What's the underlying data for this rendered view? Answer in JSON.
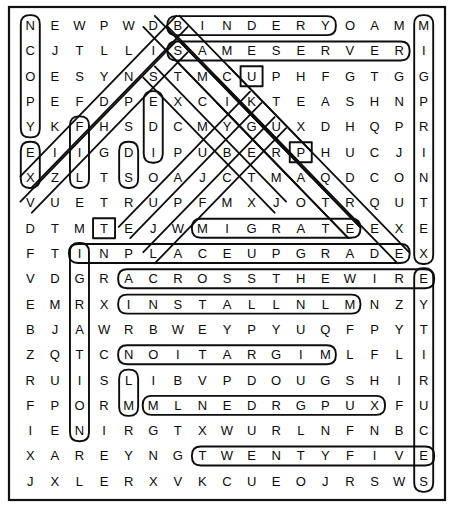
{
  "puzzle": {
    "kind": "word-search",
    "rows": 19,
    "cols": 17,
    "grid": [
      [
        "N",
        "E",
        "W",
        "P",
        "W",
        "D",
        "B",
        "I",
        "N",
        "D",
        "E",
        "R",
        "Y",
        "O",
        "A",
        "M",
        "M"
      ],
      [
        "C",
        "J",
        "T",
        "L",
        "L",
        "I",
        "S",
        "A",
        "M",
        "E",
        "S",
        "E",
        "R",
        "V",
        "E",
        "R",
        "I"
      ],
      [
        "O",
        "E",
        "S",
        "Y",
        "N",
        "S",
        "T",
        "M",
        "C",
        "U",
        "P",
        "H",
        "F",
        "G",
        "T",
        "G",
        "G"
      ],
      [
        "P",
        "E",
        "F",
        "D",
        "P",
        "E",
        "X",
        "C",
        "I",
        "K",
        "T",
        "E",
        "A",
        "S",
        "H",
        "N",
        "P"
      ],
      [
        "Y",
        "K",
        "F",
        "H",
        "S",
        "D",
        "C",
        "M",
        "Y",
        "G",
        "U",
        "X",
        "D",
        "H",
        "Q",
        "P",
        "R"
      ],
      [
        "E",
        "I",
        "I",
        "G",
        "D",
        "I",
        "P",
        "U",
        "B",
        "E",
        "R",
        "P",
        "H",
        "U",
        "C",
        "J",
        "I"
      ],
      [
        "X",
        "Z",
        "L",
        "T",
        "S",
        "O",
        "A",
        "J",
        "C",
        "T",
        "M",
        "A",
        "Q",
        "D",
        "C",
        "O",
        "N"
      ],
      [
        "V",
        "U",
        "E",
        "T",
        "R",
        "U",
        "P",
        "F",
        "M",
        "X",
        "J",
        "O",
        "T",
        "R",
        "Q",
        "U",
        "T"
      ],
      [
        "D",
        "T",
        "M",
        "T",
        "E",
        "J",
        "W",
        "M",
        "I",
        "G",
        "R",
        "A",
        "T",
        "E",
        "E",
        "X",
        "E"
      ],
      [
        "F",
        "T",
        "I",
        "N",
        "P",
        "L",
        "A",
        "C",
        "E",
        "U",
        "P",
        "G",
        "R",
        "A",
        "D",
        "E",
        "X"
      ],
      [
        "V",
        "D",
        "G",
        "R",
        "A",
        "C",
        "R",
        "O",
        "S",
        "S",
        "T",
        "H",
        "E",
        "W",
        "I",
        "R",
        "E"
      ],
      [
        "E",
        "M",
        "R",
        "X",
        "I",
        "N",
        "S",
        "T",
        "A",
        "L",
        "L",
        "N",
        "L",
        "M",
        "N",
        "Z",
        "Y"
      ],
      [
        "B",
        "J",
        "A",
        "W",
        "R",
        "B",
        "W",
        "E",
        "Y",
        "P",
        "Y",
        "U",
        "Q",
        "F",
        "P",
        "Y",
        "T"
      ],
      [
        "Z",
        "Q",
        "T",
        "C",
        "N",
        "O",
        "I",
        "T",
        "A",
        "R",
        "G",
        "I",
        "M",
        "L",
        "F",
        "L",
        "I"
      ],
      [
        "R",
        "U",
        "I",
        "S",
        "L",
        "I",
        "B",
        "V",
        "P",
        "D",
        "O",
        "U",
        "G",
        "S",
        "H",
        "I",
        "R"
      ],
      [
        "F",
        "P",
        "O",
        "R",
        "M",
        "M",
        "L",
        "N",
        "E",
        "D",
        "R",
        "G",
        "P",
        "U",
        "X",
        "F",
        "U"
      ],
      [
        "I",
        "E",
        "N",
        "I",
        "R",
        "G",
        "T",
        "X",
        "W",
        "U",
        "R",
        "L",
        "N",
        "F",
        "N",
        "B",
        "C"
      ],
      [
        "X",
        "A",
        "R",
        "E",
        "Y",
        "N",
        "G",
        "T",
        "W",
        "E",
        "N",
        "T",
        "Y",
        "F",
        "I",
        "V",
        "E"
      ],
      [
        "J",
        "X",
        "L",
        "E",
        "R",
        "X",
        "V",
        "K",
        "C",
        "U",
        "E",
        "O",
        "J",
        "R",
        "S",
        "W",
        "S"
      ]
    ],
    "found_words": [
      {
        "text": "BINDERY",
        "shape": "ring",
        "start": [
          0,
          6
        ],
        "end": [
          0,
          12
        ],
        "dir": "horizontal"
      },
      {
        "text": "SAMESERVER",
        "shape": "ring",
        "start": [
          1,
          6
        ],
        "end": [
          1,
          15
        ],
        "dir": "horizontal"
      },
      {
        "text": "MIGRATE",
        "shape": "ring",
        "start": [
          8,
          7
        ],
        "end": [
          8,
          13
        ],
        "dir": "horizontal"
      },
      {
        "text": "INPLACEUPGRADE",
        "shape": "ring",
        "start": [
          9,
          2
        ],
        "end": [
          9,
          15
        ],
        "dir": "horizontal"
      },
      {
        "text": "ACROSSTHEWIRE",
        "shape": "ring",
        "start": [
          10,
          4
        ],
        "end": [
          10,
          16
        ],
        "dir": "horizontal"
      },
      {
        "text": "INSTALLNL",
        "shape": "ring",
        "start": [
          11,
          4
        ],
        "end": [
          11,
          13
        ],
        "dir": "horizontal"
      },
      {
        "text": "NOITARGIM",
        "shape": "ring",
        "start": [
          13,
          4
        ],
        "end": [
          13,
          12
        ],
        "dir": "horizontal-reversed"
      },
      {
        "text": "MLNEDRGPUX",
        "shape": "ring",
        "start": [
          15,
          5
        ],
        "end": [
          15,
          14
        ],
        "dir": "horizontal"
      },
      {
        "text": "TWENTYFIVE",
        "shape": "ring",
        "start": [
          17,
          7
        ],
        "end": [
          17,
          16
        ],
        "dir": "horizontal"
      },
      {
        "text": "NCOPY",
        "shape": "ring",
        "start": [
          0,
          0
        ],
        "end": [
          4,
          0
        ],
        "dir": "vertical"
      },
      {
        "text": "MIGRPRINTEXE",
        "shape": "ring",
        "start": [
          0,
          16
        ],
        "end": [
          9,
          16
        ],
        "dir": "vertical"
      },
      {
        "text": "EYTIRUCES",
        "shape": "ring",
        "start": [
          10,
          16
        ],
        "end": [
          18,
          16
        ],
        "dir": "vertical-reversed"
      },
      {
        "text": "EIX",
        "shape": "ring",
        "start": [
          5,
          0
        ],
        "end": [
          6,
          0
        ],
        "dir": "vertical"
      },
      {
        "text": "FFI",
        "shape": "ring",
        "start": [
          4,
          2
        ],
        "end": [
          6,
          2
        ],
        "dir": "vertical"
      },
      {
        "text": "EDI",
        "shape": "ring",
        "start": [
          3,
          5
        ],
        "end": [
          5,
          5
        ],
        "dir": "vertical"
      },
      {
        "text": "DS",
        "shape": "ring",
        "start": [
          5,
          4
        ],
        "end": [
          6,
          4
        ],
        "dir": "vertical"
      },
      {
        "text": "INOMN",
        "shape": "ring",
        "start": [
          9,
          2
        ],
        "end": [
          16,
          2
        ],
        "dir": "vertical"
      },
      {
        "text": "LM",
        "shape": "ring",
        "start": [
          14,
          4
        ],
        "end": [
          15,
          4
        ],
        "dir": "vertical"
      },
      {
        "text": "TE",
        "shape": "ring",
        "start": [
          8,
          3
        ],
        "end": [
          8,
          4
        ],
        "dir": "diagonal-cap"
      },
      {
        "text": "UP",
        "shape": "ring",
        "start": [
          2,
          9
        ],
        "end": [
          2,
          9
        ],
        "dir": "diagonal-cap"
      },
      {
        "text": "RP",
        "shape": "ring",
        "start": [
          5,
          11
        ],
        "end": [
          5,
          11
        ],
        "dir": "diagonal-cap"
      }
    ],
    "diagonal_marks": [
      {
        "from": [
          0,
          5
        ],
        "to": [
          8,
          13
        ]
      },
      {
        "from": [
          0,
          6
        ],
        "to": [
          9,
          15
        ]
      },
      {
        "from": [
          1,
          6
        ],
        "to": [
          8,
          13
        ]
      },
      {
        "from": [
          2,
          5
        ],
        "to": [
          7,
          10
        ]
      },
      {
        "from": [
          0,
          6
        ],
        "to": [
          6,
          0
        ]
      },
      {
        "from": [
          1,
          6
        ],
        "to": [
          7,
          0
        ]
      },
      {
        "from": [
          3,
          9
        ],
        "to": [
          8,
          4
        ]
      },
      {
        "from": [
          4,
          10
        ],
        "to": [
          9,
          5
        ]
      },
      {
        "from": [
          2,
          8
        ],
        "to": [
          5,
          11
        ]
      },
      {
        "from": [
          3,
          8
        ],
        "to": [
          6,
          11
        ]
      }
    ]
  },
  "colors": {
    "ink": "#0d0d0d",
    "paper": "#ffffff",
    "rule": "#111111"
  }
}
